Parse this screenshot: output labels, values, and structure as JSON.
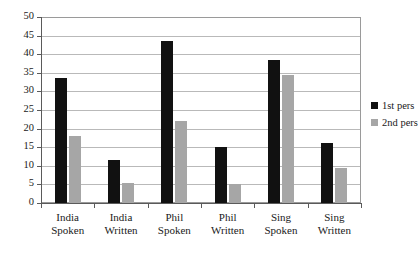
{
  "chart_data": {
    "type": "bar",
    "title": "",
    "xlabel": "",
    "ylabel": "",
    "ylim": [
      0,
      50
    ],
    "yticks": [
      0,
      5,
      10,
      15,
      20,
      25,
      30,
      35,
      40,
      45,
      50
    ],
    "ytick_labels": [
      "0",
      "5",
      "10",
      "15",
      "20",
      "25",
      "30",
      "35",
      "40",
      "45",
      "50"
    ],
    "grid": true,
    "legend_position": "right",
    "categories": [
      "India Spoken",
      "India Written",
      "Phil Spoken",
      "Phil Written",
      "Sing Spoken",
      "Sing Written"
    ],
    "category_lines": [
      [
        "India",
        "Spoken"
      ],
      [
        "India",
        "Written"
      ],
      [
        "Phil",
        "Spoken"
      ],
      [
        "Phil",
        "Written"
      ],
      [
        "Sing",
        "Spoken"
      ],
      [
        "Sing",
        "Written"
      ]
    ],
    "series": [
      {
        "name": "1st pers",
        "color": "#111111",
        "values": [
          33.5,
          11.5,
          43.5,
          15,
          38.5,
          16
        ]
      },
      {
        "name": "2nd pers",
        "color": "#a6a6a6",
        "values": [
          18,
          5.5,
          22,
          5,
          34.5,
          9.5
        ]
      }
    ]
  },
  "legend": {
    "items": [
      {
        "label": "1st pers",
        "color": "#111111"
      },
      {
        "label": "2nd pers",
        "color": "#a6a6a6"
      }
    ]
  }
}
